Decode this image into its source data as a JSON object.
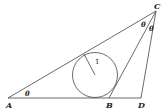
{
  "diagram": {
    "type": "geometry",
    "points": [
      {
        "name": "A",
        "label": "A",
        "x": 8,
        "y": 98
      },
      {
        "name": "B",
        "label": "B",
        "x": 109,
        "y": 98
      },
      {
        "name": "C",
        "label": "C",
        "x": 156,
        "y": 11
      },
      {
        "name": "D",
        "label": "D",
        "x": 141,
        "y": 98
      }
    ],
    "segments": [
      "AC",
      "AD",
      "BC",
      "CD"
    ],
    "incircle": {
      "cx": 95,
      "cy": 75,
      "r": 23,
      "radius_label": "1"
    },
    "angle_labels": [
      {
        "at": "A",
        "label": "θ"
      },
      {
        "at": "C (ACB)",
        "label": "θ"
      },
      {
        "at": "C (BCD)",
        "label": "θ"
      }
    ]
  }
}
